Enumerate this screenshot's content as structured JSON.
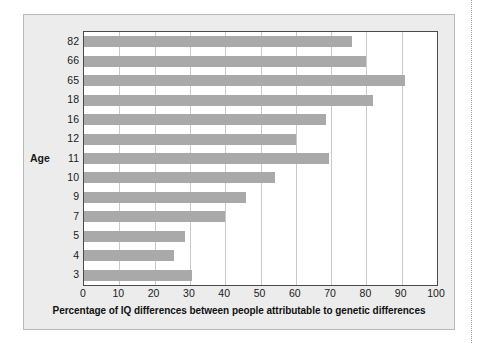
{
  "chart_data": {
    "type": "bar",
    "orientation": "horizontal",
    "title": "",
    "xlabel": "Percentage of IQ differences between people attributable to genetic differences",
    "ylabel": "Age",
    "categories": [
      "82",
      "66",
      "65",
      "18",
      "16",
      "12",
      "11",
      "10",
      "9",
      "7",
      "5",
      "4",
      "3"
    ],
    "values": [
      76,
      80,
      91,
      82,
      68.5,
      60,
      69.5,
      54,
      46,
      40,
      28.5,
      25.5,
      30.5
    ],
    "xlim": [
      0,
      100
    ],
    "xticks": [
      "0",
      "10",
      "20",
      "30",
      "40",
      "50",
      "60",
      "70",
      "80",
      "90",
      "100"
    ],
    "xtick_values": [
      0,
      10,
      20,
      30,
      40,
      50,
      60,
      70,
      80,
      90,
      100
    ],
    "grid": "vertical",
    "legend": "none",
    "bar_color": "#a9a9a9",
    "plot_background": "#ffffff",
    "panel_background": "#ececed",
    "axis_color": "#4a4a4a",
    "gridline_color": "#c9c9c9"
  }
}
